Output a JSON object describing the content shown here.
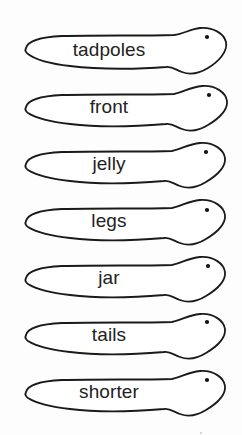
{
  "worksheet": {
    "cards": [
      {
        "word": "tadpoles"
      },
      {
        "word": "front"
      },
      {
        "word": "jelly"
      },
      {
        "word": "legs"
      },
      {
        "word": "jar"
      },
      {
        "word": "tails"
      },
      {
        "word": "shorter"
      }
    ]
  },
  "colors": {
    "outline": "#1a1a1a",
    "text": "#222222",
    "background": "#ffffff"
  }
}
